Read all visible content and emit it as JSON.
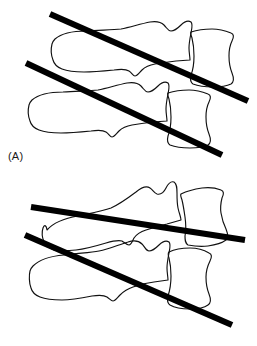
{
  "figure": {
    "background_color": "#ffffff",
    "outline_color": "#111111",
    "reference_line_color": "#000000",
    "width": 257,
    "height": 346
  },
  "panels": [
    {
      "id": "A",
      "label": "(A)",
      "description": "Two lateral cervical vertebrae with parallel endplate reference lines",
      "reference_lines": [
        {
          "name": "upper-reference-line",
          "x1": 50,
          "y1": 14,
          "x2": 248,
          "y2": 101,
          "thickness": 6.2,
          "color": "#000000"
        },
        {
          "name": "lower-reference-line",
          "x1": 26,
          "y1": 63,
          "x2": 222,
          "y2": 155,
          "thickness": 6.2,
          "color": "#000000"
        }
      ],
      "vertebrae": [
        {
          "name": "upper-vertebra",
          "body": "anterior-block-upper",
          "process": "spinous-process-upper"
        },
        {
          "name": "lower-vertebra",
          "body": "anterior-block-lower",
          "process": "spinous-process-lower"
        }
      ]
    },
    {
      "id": "B",
      "label": "(B)",
      "description": "Two lateral cervical vertebrae with converging endplate reference lines",
      "reference_lines": [
        {
          "name": "upper-reference-line",
          "x1": 31,
          "y1": 32,
          "x2": 245,
          "y2": 65,
          "thickness": 6.2,
          "color": "#000000"
        },
        {
          "name": "lower-reference-line",
          "x1": 25,
          "y1": 60,
          "x2": 232,
          "y2": 150,
          "thickness": 6.2,
          "color": "#000000"
        }
      ],
      "vertebrae": [
        {
          "name": "upper-vertebra",
          "body": "anterior-block-upper",
          "process": "spinous-process-upper"
        },
        {
          "name": "lower-vertebra",
          "body": "anterior-block-lower",
          "process": "spinous-process-lower"
        }
      ]
    }
  ]
}
